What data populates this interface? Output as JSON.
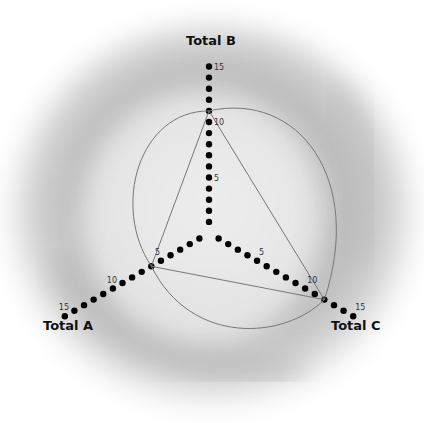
{
  "chart_data": {
    "type": "radar",
    "title": "",
    "axes": [
      "Total A",
      "Total B",
      "Total C"
    ],
    "tick_labels": [
      "5",
      "10",
      "15"
    ],
    "range": [
      0,
      15
    ],
    "series": [
      {
        "name": "triangle",
        "values": {
          "Total A": 6,
          "Total B": 11,
          "Total C": 12
        }
      }
    ],
    "grid": false,
    "legend": "none"
  },
  "labels": {
    "axis_a": "Total A",
    "axis_b": "Total B",
    "axis_c": "Total C",
    "tick5": "5",
    "tick10": "10",
    "tick15": "15"
  }
}
